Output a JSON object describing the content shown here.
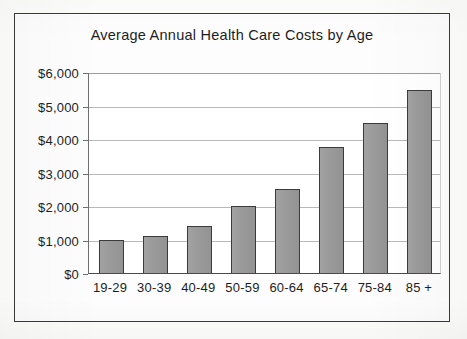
{
  "chart_data": {
    "type": "bar",
    "title": "Average Annual Health Care Costs by Age",
    "xlabel": "",
    "ylabel": "",
    "categories": [
      "19-29",
      "30-39",
      "40-49",
      "50-59",
      "60-64",
      "65-74",
      "75-84",
      "85 +"
    ],
    "values": [
      1000,
      1100,
      1400,
      2000,
      2500,
      3750,
      4475,
      5475
    ],
    "ylim": [
      0,
      6000
    ],
    "ytick_values": [
      0,
      1000,
      2000,
      3000,
      4000,
      5000,
      6000
    ],
    "ytick_labels": [
      "$0",
      "$1,000",
      "$2,000",
      "$3,000",
      "$4,000",
      "$5,000",
      "$6,000"
    ],
    "grid": true,
    "legend": false,
    "legend_position": "none",
    "bar_color": "#9a9a9a",
    "bar_border_color": "#3b3b3b",
    "gridline_color": "#b9b9b9",
    "frame_color": "#3a3a3a",
    "background_color": "#fdfdfd"
  }
}
